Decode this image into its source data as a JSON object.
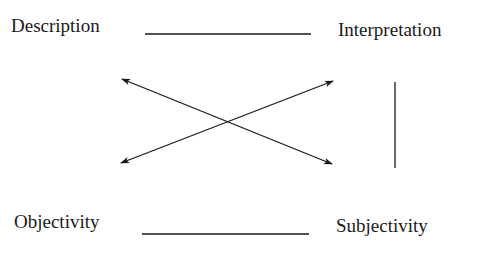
{
  "diagram": {
    "labels": {
      "top_left": "Description",
      "top_right": "Interpretation",
      "bottom_left": "Objectivity",
      "bottom_right": "Subjectivity"
    },
    "connectors": [
      {
        "from": "Description",
        "to": "Interpretation",
        "type": "line"
      },
      {
        "from": "Objectivity",
        "to": "Subjectivity",
        "type": "line"
      },
      {
        "from": "Interpretation",
        "to": "Subjectivity",
        "type": "line"
      },
      {
        "from": "Description",
        "to": "Subjectivity",
        "type": "double-arrow"
      },
      {
        "from": "Interpretation",
        "to": "Objectivity",
        "type": "double-arrow"
      }
    ],
    "colors": {
      "ink": "#1a1a1a",
      "background": "#ffffff"
    }
  }
}
